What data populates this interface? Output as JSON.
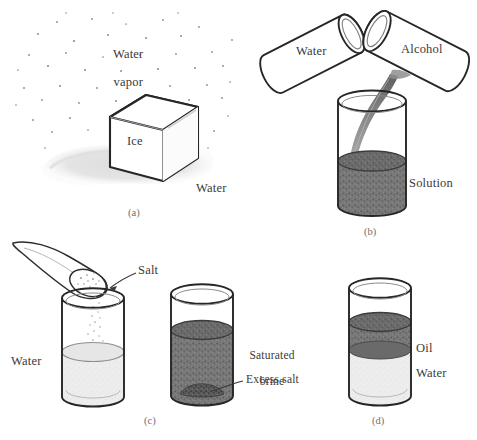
{
  "figure": {
    "panels": [
      {
        "id": "a",
        "tag": "(a)",
        "labels": {
          "vapor_line1": "Water",
          "vapor_line2": "vapor",
          "solid": "Ice",
          "liquid": "Water"
        }
      },
      {
        "id": "b",
        "tag": "(b)",
        "labels": {
          "cylinder_left": "Water",
          "cylinder_right": "Alcohol",
          "beaker": "Solution"
        }
      },
      {
        "id": "c",
        "tag": "(c)",
        "labels": {
          "spoon": "Salt",
          "beaker_left": "Water",
          "brine_line1": "Saturated",
          "brine_line2": "brine",
          "excess": "Excess salt"
        }
      },
      {
        "id": "d",
        "tag": "(d)",
        "labels": {
          "top_layer": "Oil",
          "bottom_layer": "Water"
        }
      }
    ]
  },
  "colors": {
    "ink": "#2b2b2b",
    "label_text": "#3a3a3a",
    "panel_tag": "#6f6f6f",
    "dark_liquid": "#6f6f6f",
    "light_liquid": "#ededed",
    "puddle": "#e0e0e0",
    "stream": "#8a8a8a",
    "salt_grain": "#9a9a9a",
    "background": "#ffffff"
  },
  "icons": {
    "ice_cube": "cube-icon",
    "beaker": "beaker-icon",
    "cylinder": "cylinder-icon",
    "spoon": "spoon-icon",
    "pointer": "arrow-icon",
    "vapor": "dots-icon"
  }
}
